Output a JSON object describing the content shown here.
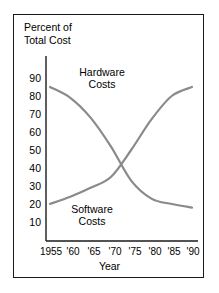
{
  "chart_data": {
    "type": "line",
    "title_line1": "Percent of",
    "title_line2": "Total Cost",
    "xlabel": "Year",
    "ylabel": "Percent of Total Cost",
    "categories": [
      "1955",
      "'60",
      "'65",
      "'70",
      "'75",
      "'80",
      "'85",
      "'90"
    ],
    "x": [
      1955,
      1960,
      1965,
      1970,
      1975,
      1980,
      1985,
      1990
    ],
    "xlim": [
      1955,
      1990
    ],
    "ylim": [
      0,
      95
    ],
    "yticks": [
      90,
      80,
      70,
      60,
      50,
      40,
      30,
      20,
      10
    ],
    "grid": false,
    "legend_position": "inline-annotations",
    "line_color": "#8a8a8a",
    "axis_color": "#1a1a1a",
    "series": [
      {
        "name": "Hardware Costs",
        "label": "Hardware\nCosts",
        "label_line1": "Hardware",
        "label_line2": "Costs",
        "values": [
          85,
          79,
          68,
          52,
          33,
          23,
          20,
          18
        ],
        "color": "#8a8a8a"
      },
      {
        "name": "Software Costs",
        "label": "Software\nCosts",
        "label_line1": "Software",
        "label_line2": "Costs",
        "values": [
          20,
          24,
          29,
          35,
          50,
          67,
          80,
          85
        ],
        "color": "#8a8a8a"
      }
    ],
    "annotations": [
      {
        "text": "Hardware Costs",
        "series": "Hardware Costs"
      },
      {
        "text": "Software Costs",
        "series": "Software Costs"
      }
    ],
    "crossover": {
      "year": 1972,
      "value": 38
    }
  }
}
